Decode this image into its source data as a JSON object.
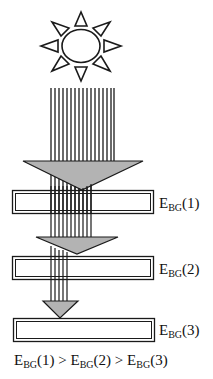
{
  "diagram": {
    "type": "band-gap tandem absorption",
    "source_icon": "sun-icon",
    "colors": {
      "stroke": "#1a1a1a",
      "triangle_fill": "#b3b3b3",
      "bar_fill": "#ffffff",
      "background": "#ffffff"
    },
    "layers": [
      {
        "id": 1,
        "label_main": "E",
        "label_sub": "BG",
        "label_tail": "(1)"
      },
      {
        "id": 2,
        "label_main": "E",
        "label_sub": "BG",
        "label_tail": "(2)"
      },
      {
        "id": 3,
        "label_main": "E",
        "label_sub": "BG",
        "label_tail": "(3)"
      }
    ],
    "relation": {
      "t1_main": "E",
      "t1_sub": "BG",
      "t1_tail": "(1) > ",
      "t2_main": "E",
      "t2_sub": "BG",
      "t2_tail": "(2) > ",
      "t3_main": "E",
      "t3_sub": "BG",
      "t3_tail": "(3)"
    }
  }
}
